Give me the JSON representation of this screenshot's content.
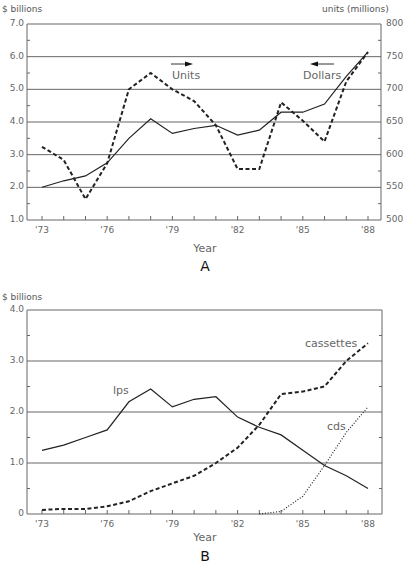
{
  "chart_data": [
    {
      "id": "A",
      "type": "line",
      "panel_label": "A",
      "title": "",
      "xlabel": "Year",
      "ylabel": "$ billions",
      "y2label": "units (millions)",
      "x": [
        "'73",
        "'74",
        "'75",
        "'76",
        "'77",
        "'78",
        "'79",
        "'80",
        "'81",
        "'82",
        "'83",
        "'84",
        "'85",
        "'86",
        "'87",
        "'88"
      ],
      "x_tick_labels": [
        "'73",
        "'76",
        "'79",
        "'82",
        "'85",
        "'88"
      ],
      "y_tick_labels": [
        "7.0",
        "6.0",
        "5.0",
        "4.0",
        "3.0",
        "2.0",
        "1.0"
      ],
      "y2_tick_labels": [
        "800",
        "750",
        "700",
        "650",
        "600",
        "550",
        "500"
      ],
      "ylim": [
        1.0,
        7.0
      ],
      "y2lim": [
        500,
        800
      ],
      "grid": true,
      "series": [
        {
          "name": "Dollars",
          "axis": "left",
          "style": "solid",
          "values": [
            2.0,
            2.2,
            2.35,
            2.75,
            3.5,
            4.1,
            3.65,
            3.8,
            3.9,
            3.6,
            3.75,
            4.3,
            4.3,
            4.55,
            5.4,
            6.15
          ]
        },
        {
          "name": "Units",
          "axis": "right",
          "style": "dashed",
          "values": [
            612,
            592,
            532,
            587,
            700,
            725,
            700,
            682,
            645,
            578,
            578,
            680,
            652,
            620,
            712,
            757
          ]
        }
      ],
      "annotations": [
        {
          "text": "Units",
          "arrow": "right"
        },
        {
          "text": "Dollars",
          "arrow": "left"
        }
      ]
    },
    {
      "id": "B",
      "type": "line",
      "panel_label": "B",
      "title": "",
      "xlabel": "Year",
      "ylabel": "$ billions",
      "x": [
        "'73",
        "'74",
        "'75",
        "'76",
        "'77",
        "'78",
        "'79",
        "'80",
        "'81",
        "'82",
        "'83",
        "'84",
        "'85",
        "'86",
        "'87",
        "'88"
      ],
      "x_tick_labels": [
        "'73",
        "'76",
        "'79",
        "'82",
        "'85",
        "'88"
      ],
      "y_tick_labels": [
        "4.0",
        "3.0",
        "2.0",
        "1.0",
        "0"
      ],
      "ylim": [
        0,
        4.0
      ],
      "grid": true,
      "series": [
        {
          "name": "lps",
          "style": "solid",
          "values": [
            1.25,
            1.35,
            1.5,
            1.65,
            2.2,
            2.45,
            2.1,
            2.25,
            2.3,
            1.9,
            1.7,
            1.55,
            1.25,
            0.95,
            0.75,
            0.5
          ]
        },
        {
          "name": "cassettes",
          "style": "dashed",
          "values": [
            0.08,
            0.1,
            0.1,
            0.15,
            0.25,
            0.45,
            0.6,
            0.75,
            1.0,
            1.3,
            1.75,
            2.35,
            2.4,
            2.5,
            3.0,
            3.35
          ]
        },
        {
          "name": "cds",
          "style": "dotted",
          "values": [
            null,
            null,
            null,
            null,
            null,
            null,
            null,
            null,
            null,
            null,
            0.0,
            0.05,
            0.35,
            0.95,
            1.6,
            2.1
          ]
        }
      ]
    }
  ],
  "labels": {
    "a_ylabel": "$ billions",
    "a_y2label": "units (millions)",
    "a_xlabel": "Year",
    "a_panel": "A",
    "a_units": "Units",
    "a_dollars": "Dollars",
    "b_ylabel": "$ billions",
    "b_xlabel": "Year",
    "b_panel": "B",
    "b_lps": "lps",
    "b_cassettes": "cassettes",
    "b_cds": "cds"
  },
  "colors": {
    "line": "#222222",
    "grid": "#666666",
    "text": "#555555"
  }
}
